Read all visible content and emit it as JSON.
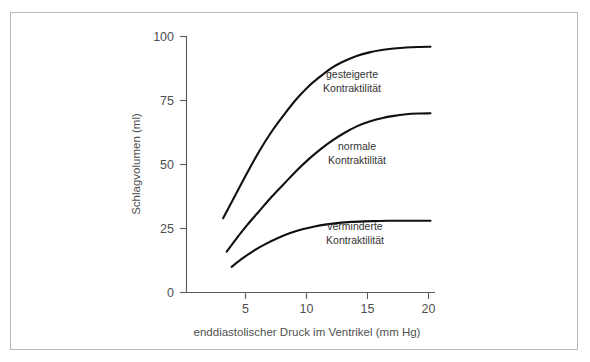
{
  "chart_data": {
    "type": "line",
    "title": "",
    "xlabel": "enddiastolischer Druck im Ventrikel (mm Hg)",
    "ylabel": "Schlagvolumen (ml)",
    "xlim": [
      0,
      21
    ],
    "ylim": [
      0,
      100
    ],
    "xticks": [
      5,
      10,
      15,
      20
    ],
    "yticks": [
      0,
      25,
      50,
      75,
      100
    ],
    "xtick_labels": [
      "5",
      "10",
      "15",
      "20"
    ],
    "ytick_labels": [
      "0",
      "25",
      "50",
      "75",
      "100"
    ],
    "grid": false,
    "legend_position": "inline-annotations",
    "series": [
      {
        "name": "gesteigerte Kontraktilität",
        "label_line1": "gesteigerte",
        "label_line2": "Kontraktilität",
        "color": "#101010",
        "x": [
          3.0,
          4.0,
          5.0,
          6.0,
          7.0,
          8.0,
          9.0,
          10.0,
          11.0,
          12.0,
          13.0,
          14.0,
          15.0,
          16.0,
          17.0,
          18.0,
          19.0,
          20.0
        ],
        "y": [
          29,
          38,
          47,
          55.5,
          63,
          69.5,
          75.5,
          80.5,
          84.5,
          88,
          90.5,
          92.5,
          93.8,
          94.7,
          95.3,
          95.7,
          95.9,
          96.0
        ]
      },
      {
        "name": "normale Kontraktilität",
        "label_line1": "normale",
        "label_line2": "Kontraktilität",
        "color": "#101010",
        "x": [
          3.3,
          4.0,
          5.0,
          6.0,
          7.0,
          8.0,
          9.0,
          10.0,
          11.0,
          12.0,
          13.0,
          14.0,
          15.0,
          16.0,
          17.0,
          18.0,
          19.0,
          20.0
        ],
        "y": [
          16,
          20.5,
          26.5,
          32,
          37.5,
          42.5,
          47.5,
          52,
          56,
          59.5,
          62.5,
          65,
          66.8,
          68.1,
          69.0,
          69.6,
          69.9,
          70.0
        ]
      },
      {
        "name": "verminderte Kontraktilität",
        "label_line1": "verminderte",
        "label_line2": "Kontraktilität",
        "color": "#101010",
        "x": [
          3.7,
          4.5,
          5.5,
          6.5,
          7.5,
          8.5,
          9.5,
          10.5,
          11.5,
          12.5,
          13.5,
          14.5,
          15.5,
          16.5,
          17.5,
          18.5,
          19.5,
          20.0
        ],
        "y": [
          10.0,
          13.0,
          16.3,
          19.0,
          21.3,
          23.2,
          24.7,
          25.8,
          26.6,
          27.2,
          27.6,
          27.8,
          27.9,
          28.0,
          28.0,
          28.0,
          28.0,
          28.0
        ]
      }
    ],
    "annotations": [
      {
        "text_line1": "gesteigerte",
        "text_line2": "Kontraktilität",
        "x_px": 352,
        "y_px": 78
      },
      {
        "text_line1": "normale",
        "text_line2": "Kontraktilität",
        "x_px": 357,
        "y_px": 150
      },
      {
        "text_line1": "verminderte",
        "text_line2": "Kontraktilität",
        "x_px": 355,
        "y_px": 230
      }
    ],
    "colors": {
      "curve": "#101010",
      "axis": "#5a5a5a",
      "text": "#4f4f4f",
      "frame": "#b9b9b9",
      "background": "#ffffff"
    }
  }
}
